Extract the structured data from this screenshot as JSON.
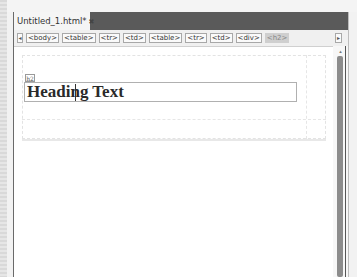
{
  "document_tab": {
    "title": "Untitled_1.html*",
    "close_icon": "close-icon"
  },
  "breadcrumb": {
    "items": [
      "<body>",
      "<table>",
      "<tr>",
      "<td>",
      "<table>",
      "<tr>",
      "<td>",
      "<div>",
      "<h2>"
    ],
    "active_index": 8,
    "left_arrow": "◂",
    "right_arrow": "▸"
  },
  "design_view": {
    "element_tag_label": "h2",
    "heading_text": "Heading Text"
  },
  "scrollbar": {
    "up_arrow": "▴"
  },
  "colors": {
    "tabbar_bg": "#5a5a5a",
    "tab_bg": "#f5f5f5",
    "crumb_active_bg": "#cfcfcf",
    "heading_color": "#2a2a2a"
  }
}
